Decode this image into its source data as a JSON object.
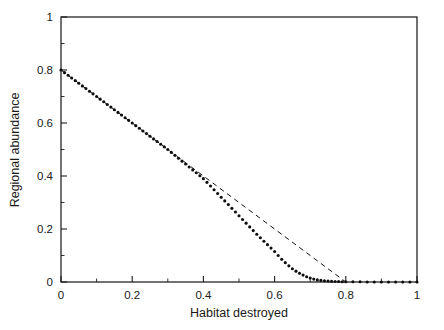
{
  "figure": {
    "background_color": "#ffffff",
    "ink_color": "#111111"
  },
  "chart_data": {
    "type": "line",
    "title": "",
    "subtitle": "",
    "xlabel": "Habitat destroyed",
    "ylabel": "Regional abundance",
    "xlim": [
      0,
      1
    ],
    "ylim": [
      0,
      1
    ],
    "grid": false,
    "legend": null,
    "legend_position": "none",
    "frame": "box",
    "tick_direction": "in",
    "xticks": [
      0,
      0.2,
      0.4,
      0.6,
      0.8,
      1
    ],
    "xticklabels": [
      "0",
      "0.2",
      "0.4",
      "0.6",
      "0.8",
      "1"
    ],
    "xminorticks": [
      0.1,
      0.3,
      0.5,
      0.7,
      0.9
    ],
    "yticks": [
      0,
      0.2,
      0.4,
      0.6,
      0.8,
      1
    ],
    "yticklabels": [
      "0",
      "0.2",
      "0.4",
      "0.6",
      "0.8",
      "1"
    ],
    "yminorticks": [
      0.1,
      0.3,
      0.5,
      0.7,
      0.9
    ],
    "annotations": [],
    "series": [
      {
        "name": "abundance-dotted",
        "style": "dotted-markers",
        "marker": "circle",
        "marker_size_px": 3.1,
        "x": [
          0.0,
          0.01,
          0.02,
          0.03,
          0.04,
          0.05,
          0.06,
          0.07,
          0.08,
          0.09,
          0.1,
          0.11,
          0.12,
          0.13,
          0.14,
          0.15,
          0.16,
          0.17,
          0.18,
          0.19,
          0.2,
          0.21,
          0.22,
          0.23,
          0.24,
          0.25,
          0.26,
          0.27,
          0.28,
          0.29,
          0.3,
          0.31,
          0.32,
          0.33,
          0.34,
          0.35,
          0.36,
          0.37,
          0.38,
          0.39,
          0.4,
          0.41,
          0.42,
          0.43,
          0.44,
          0.45,
          0.46,
          0.47,
          0.48,
          0.49,
          0.5,
          0.51,
          0.52,
          0.53,
          0.54,
          0.55,
          0.56,
          0.57,
          0.58,
          0.59,
          0.6,
          0.61,
          0.62,
          0.63,
          0.64,
          0.65,
          0.66,
          0.67,
          0.68,
          0.69,
          0.7,
          0.71,
          0.72,
          0.73,
          0.74,
          0.75,
          0.76,
          0.77,
          0.78,
          0.79,
          0.8,
          0.82,
          0.84,
          0.86,
          0.88,
          0.9,
          0.92,
          0.94,
          0.96,
          0.98,
          1.0
        ],
        "y": [
          0.8,
          0.79,
          0.78,
          0.77,
          0.76,
          0.75,
          0.74,
          0.73,
          0.72,
          0.71,
          0.7,
          0.69,
          0.68,
          0.67,
          0.66,
          0.65,
          0.64,
          0.63,
          0.62,
          0.61,
          0.6,
          0.59,
          0.58,
          0.57,
          0.56,
          0.55,
          0.54,
          0.53,
          0.52,
          0.51,
          0.5,
          0.489,
          0.478,
          0.467,
          0.456,
          0.445,
          0.434,
          0.423,
          0.412,
          0.401,
          0.39,
          0.376,
          0.362,
          0.348,
          0.334,
          0.32,
          0.306,
          0.292,
          0.278,
          0.264,
          0.25,
          0.236,
          0.222,
          0.208,
          0.194,
          0.18,
          0.167,
          0.154,
          0.141,
          0.128,
          0.115,
          0.1,
          0.086,
          0.073,
          0.061,
          0.05,
          0.041,
          0.033,
          0.026,
          0.02,
          0.015,
          0.011,
          0.008,
          0.006,
          0.005,
          0.004,
          0.003,
          0.002,
          0.002,
          0.001,
          0.001,
          0.001,
          0.001,
          0.0,
          0.0,
          0.0,
          0.0,
          0.0,
          0.0,
          0.0,
          0.0
        ]
      },
      {
        "name": "extinction-threshold-dashed",
        "style": "dashed-line",
        "x": [
          0.0,
          0.4,
          0.8
        ],
        "y": [
          0.8,
          0.4,
          0.0
        ],
        "x_intercept": 0.8
      }
    ]
  }
}
